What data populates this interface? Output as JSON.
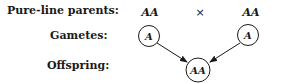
{
  "rows": {
    "parents_label": "Pure-line parents:",
    "gametes_label": "Gametes:",
    "offspring_label": "Offspring:"
  },
  "parents": {
    "left": "AA",
    "cross_symbol": "×",
    "right": "AA"
  },
  "gametes": {
    "left": "A",
    "right": "A"
  },
  "offspring": {
    "genotype": "AA"
  },
  "colors": {
    "ink": "#1a1a1a",
    "background": "#ffffff"
  }
}
